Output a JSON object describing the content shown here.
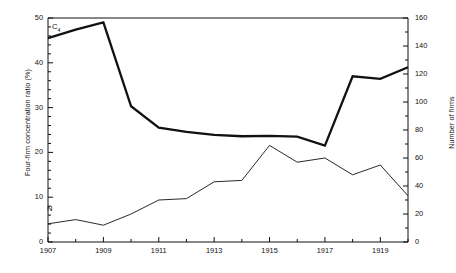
{
  "chart_data": {
    "type": "line",
    "title": "",
    "xlabel": "",
    "ylabel": "Four-firm concentration ratio (%)",
    "y2label": "Number of firms",
    "x": [
      1907,
      1908,
      1909,
      1910,
      1911,
      1912,
      1913,
      1914,
      1915,
      1916,
      1917,
      1918,
      1919,
      1920
    ],
    "xlim": [
      1907,
      1920
    ],
    "ylim": [
      0,
      50
    ],
    "y2lim": [
      0,
      160
    ],
    "xticks": [
      1907,
      1908,
      1909,
      1910,
      1911,
      1912,
      1913,
      1914,
      1915,
      1916,
      1917,
      1918,
      1919,
      1920
    ],
    "xticklabels": [
      "1907",
      "",
      "1909",
      "",
      "1911",
      "",
      "1913",
      "",
      "1915",
      "",
      "1917",
      "",
      "1919",
      ""
    ],
    "yticks": [
      0,
      10,
      20,
      30,
      40,
      50
    ],
    "yticklabels": [
      "0",
      "10",
      "20",
      "30",
      "40",
      "50"
    ],
    "y2ticks": [
      0,
      20,
      40,
      60,
      80,
      100,
      120,
      140,
      160
    ],
    "y2ticklabels": [
      "0",
      "20",
      "40",
      "60",
      "80",
      "100",
      "120",
      "140",
      "160"
    ],
    "grid": false,
    "legend": "inline-annotations",
    "series": [
      {
        "name": "C4",
        "label": "C",
        "label_sub": "4",
        "axis": "left",
        "units": "%",
        "linewidth": "thick",
        "values": [
          45.5,
          47.4,
          49.0,
          30.3,
          25.5,
          24.6,
          23.9,
          23.6,
          23.7,
          23.5,
          21.5,
          37.0,
          36.4,
          39.0
        ]
      },
      {
        "name": "N",
        "label": "N",
        "axis": "right",
        "units": "firms",
        "linewidth": "thin",
        "values": [
          13,
          16,
          12,
          20,
          30,
          31,
          43,
          44,
          69,
          57,
          60,
          48,
          55,
          33
        ]
      }
    ]
  },
  "annotations": {
    "c4_tag": "C",
    "c4_tag_sub": "4",
    "n_tag": "N"
  },
  "caption": {
    "text": ""
  },
  "colors": {
    "line": "#111111",
    "axis": "#111111",
    "background": "#ffffff"
  }
}
